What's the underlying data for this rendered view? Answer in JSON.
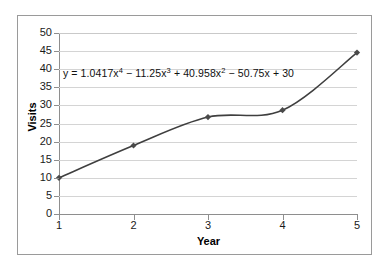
{
  "chart_data": {
    "type": "line",
    "title": "",
    "xlabel": "Year",
    "ylabel": "Visits",
    "x": [
      1,
      2,
      3,
      4,
      5
    ],
    "values": [
      10,
      18.92,
      26.77,
      28.67,
      44.58
    ],
    "series": [
      {
        "name": "Visits",
        "values": [
          10,
          18.92,
          26.77,
          28.67,
          44.58
        ]
      }
    ],
    "xlim": [
      1,
      5
    ],
    "ylim": [
      0,
      50
    ],
    "y_ticks": [
      0,
      5,
      10,
      15,
      20,
      25,
      30,
      35,
      40,
      45,
      50
    ],
    "x_ticks": [
      1,
      2,
      3,
      4,
      5
    ],
    "y_tick_labels": [
      "0",
      "5",
      "10",
      "15",
      "20",
      "25",
      "30",
      "35",
      "40",
      "45",
      "50"
    ],
    "x_tick_labels": [
      "1",
      "2",
      "3",
      "4",
      "5"
    ],
    "grid": "horizontal",
    "legend": "none",
    "marker": "diamond",
    "line_color": "#3f3f3f",
    "marker_color": "#4a4a4a",
    "gridline_color": "#d4d4d4",
    "axis_color": "#8e8e8e",
    "background_color": "#ffffff",
    "border_color": "#9a9a9a",
    "annotations": [
      {
        "name": "trendline-equation",
        "text": "y = 1.0417x4 − 11.25x3 + 40.958x2 − 50.75x + 30",
        "parts": {
          "lead": "y = 1.0417x",
          "exp1": "4",
          "mid1": " − 11.25x",
          "exp2": "3",
          "mid2": " + 40.958x",
          "exp3": "2",
          "tail": " − 50.75x + 30"
        }
      }
    ]
  }
}
